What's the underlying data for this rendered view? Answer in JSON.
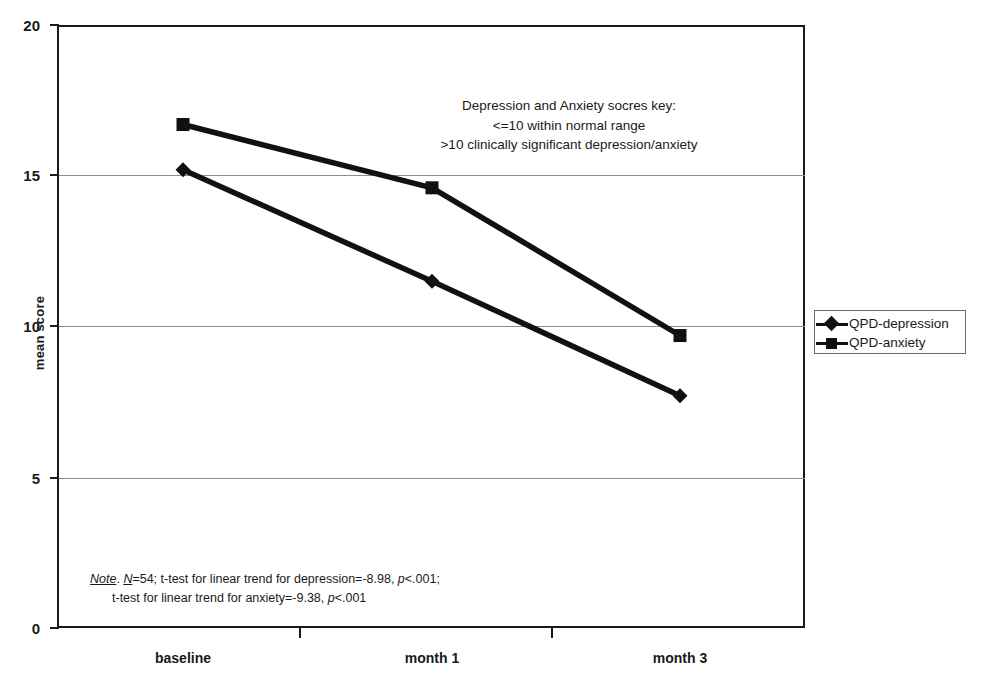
{
  "chart_data": {
    "type": "line",
    "title": "",
    "xlabel": "",
    "ylabel": "mean score",
    "categories": [
      "baseline",
      "month 1",
      "month 3"
    ],
    "ylim": [
      0,
      20
    ],
    "yticks": [
      0,
      5,
      10,
      15,
      20
    ],
    "grid": true,
    "legend_position": "right",
    "series": [
      {
        "name": "QPD-depression",
        "marker": "diamond",
        "values": [
          15.2,
          11.5,
          7.7
        ]
      },
      {
        "name": "QPD-anxiety",
        "marker": "square",
        "values": [
          16.7,
          14.6,
          9.7
        ]
      }
    ],
    "annotations": [
      {
        "name": "scores-key",
        "lines": [
          "Depression and Anxiety socres key:",
          "<=10 within normal range",
          ">10 clinically significant depression/anxiety"
        ]
      },
      {
        "name": "statistics-note",
        "lines": [
          "Note. N=54; t-test for linear trend for depression=-8.98, p<.001;",
          "t-test for linear trend for anxiety=-9.38, p<.001"
        ]
      }
    ]
  },
  "axes": {
    "y_title": "mean score",
    "y_tick_labels": [
      "20",
      "15",
      "10",
      "5",
      "0"
    ],
    "x_tick_labels": [
      "baseline",
      "month 1",
      "month 3"
    ]
  },
  "legend": {
    "items": [
      {
        "label": "QPD-depression",
        "marker": "diamond"
      },
      {
        "label": "QPD-anxiety",
        "marker": "square"
      }
    ]
  },
  "key_note": {
    "line1": "Depression and Anxiety socres key:",
    "line2": "<=10 within normal range",
    "line3": ">10 clinically significant depression/anxiety"
  },
  "stat_note": {
    "note_word": "Note",
    "period": ".",
    "n_symbol": "N",
    "line1_rest": "=54; t-test for linear trend for depression=-8.98, ",
    "p_symbol_1": "p",
    "line1_tail": "<.001;",
    "line2_head": "t-test for linear trend for anxiety=-9.38, ",
    "p_symbol_2": "p",
    "line2_tail": "<.001"
  },
  "colors": {
    "line": "#111111",
    "axis": "#1a1a1a",
    "grid": "#8d8d8d"
  }
}
